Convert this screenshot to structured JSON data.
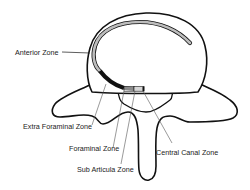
{
  "diagram": {
    "labels": {
      "anterior": "Anterior Zone",
      "extra_foraminal": "Extra Foraminal Zone",
      "foraminal": "Foraminal Zone",
      "sub_articular": "Sub Articula Zone",
      "central_canal": "Central Canal Zone"
    },
    "colors": {
      "outline": "#111111",
      "anterior_band": "#bdbdbd",
      "foraminal_band": "#111111",
      "sub_articular_band": "#9a9a9a",
      "central_band": "#d0d0d0",
      "leader_line": "#444444",
      "background": "#ffffff"
    }
  }
}
